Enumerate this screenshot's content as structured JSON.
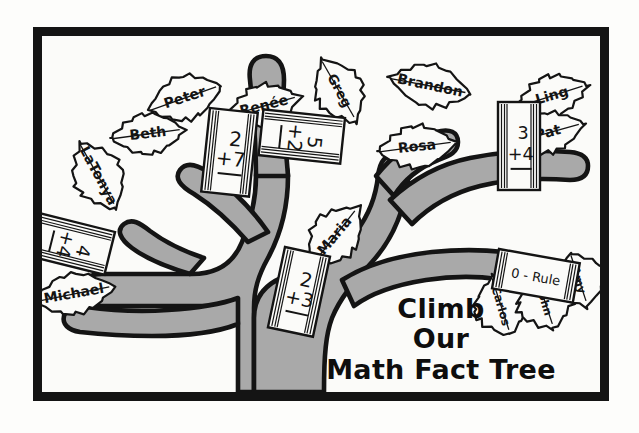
{
  "poster": {
    "title_lines": [
      "Climb",
      "Our",
      "Math Fact Tree"
    ],
    "border_color": "#141414",
    "trunk_color": "#a9a9a9",
    "paper_color": "#fbfbf9",
    "ink_color": "#141414"
  },
  "leaves": [
    {
      "id": "peter",
      "name": "Peter",
      "x": 143,
      "y": 62,
      "w": 78,
      "h": 48,
      "rot": -18
    },
    {
      "id": "beth",
      "name": "Beth",
      "x": 106,
      "y": 98,
      "w": 76,
      "h": 44,
      "rot": -6
    },
    {
      "id": "renee",
      "name": "Renée",
      "x": 222,
      "y": 70,
      "w": 76,
      "h": 46,
      "rot": -14
    },
    {
      "id": "greg",
      "name": "Greg",
      "x": 297,
      "y": 55,
      "w": 72,
      "h": 52,
      "rot": 62
    },
    {
      "id": "brandon",
      "name": "Brandon",
      "x": 388,
      "y": 50,
      "w": 84,
      "h": 46,
      "rot": 12
    },
    {
      "id": "ling",
      "name": "Ling",
      "x": 510,
      "y": 60,
      "w": 76,
      "h": 44,
      "rot": -16
    },
    {
      "id": "pat",
      "name": "Pat",
      "x": 506,
      "y": 97,
      "w": 76,
      "h": 44,
      "rot": -14
    },
    {
      "id": "latonya",
      "name": "LaTonya",
      "x": 56,
      "y": 140,
      "w": 76,
      "h": 54,
      "rot": 62
    },
    {
      "id": "rosa",
      "name": "Rosa",
      "x": 375,
      "y": 111,
      "w": 80,
      "h": 46,
      "rot": -6
    },
    {
      "id": "maria",
      "name": "Maria",
      "x": 293,
      "y": 200,
      "w": 76,
      "h": 52,
      "rot": -50
    },
    {
      "id": "michael",
      "name": "Michael",
      "x": 32,
      "y": 258,
      "w": 84,
      "h": 44,
      "rot": -10
    },
    {
      "id": "carlos",
      "name": "Carlos",
      "x": 459,
      "y": 270,
      "w": 62,
      "h": 60,
      "rot": 74
    },
    {
      "id": "john",
      "name": "John",
      "x": 503,
      "y": 266,
      "w": 58,
      "h": 62,
      "rot": 74
    },
    {
      "id": "amy",
      "name": "Amy",
      "x": 537,
      "y": 244,
      "w": 56,
      "h": 60,
      "rot": 74
    }
  ],
  "cards": [
    {
      "id": "card-2-plus-7",
      "top": "2",
      "bottom": "+7",
      "x": 168,
      "y": 72,
      "w": 48,
      "h": 84,
      "rot": 6
    },
    {
      "id": "card-5-plus-2",
      "top": "5",
      "bottom": "+2",
      "x": 303,
      "y": 82,
      "w": 46,
      "h": 82,
      "rot": 96
    },
    {
      "id": "card-3-plus-4",
      "top": "3",
      "bottom": "+4",
      "x": 456,
      "y": 66,
      "w": 42,
      "h": 88,
      "rot": 0
    },
    {
      "id": "card-4-plus-4",
      "top": "4",
      "bottom": "+4",
      "x": 73,
      "y": 196,
      "w": 44,
      "h": 78,
      "rot": 104
    },
    {
      "id": "card-2-plus-3",
      "top": "2",
      "bottom": "+3",
      "x": 243,
      "y": 211,
      "w": 46,
      "h": 82,
      "rot": 12
    }
  ],
  "rule_card": {
    "id": "card-0-rule",
    "label": "0 - Rule",
    "x": 457,
    "y": 213,
    "w": 82,
    "h": 40,
    "rot": 10
  }
}
